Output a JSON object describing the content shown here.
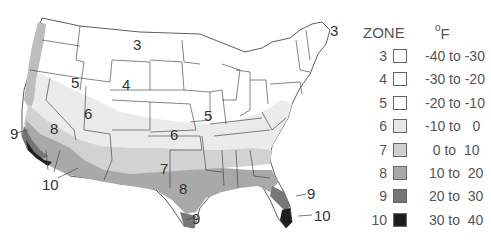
{
  "map": {
    "title": "Plant hardiness zones of the contiguous United States",
    "region_labels": [
      {
        "text": "3",
        "x": 133,
        "y": 36
      },
      {
        "text": "3",
        "x": 372,
        "y": 22
      },
      {
        "text": "4",
        "x": 122,
        "y": 76
      },
      {
        "text": "5",
        "x": 71,
        "y": 74
      },
      {
        "text": "5",
        "x": 204,
        "y": 107
      },
      {
        "text": "6",
        "x": 84,
        "y": 105
      },
      {
        "text": "6",
        "x": 170,
        "y": 126
      },
      {
        "text": "7",
        "x": 160,
        "y": 160
      },
      {
        "text": "8",
        "x": 50,
        "y": 120
      },
      {
        "text": "8",
        "x": 179,
        "y": 180
      },
      {
        "text": "9",
        "x": 10,
        "y": 128
      },
      {
        "text": "9",
        "x": 192,
        "y": 212
      },
      {
        "text": "9",
        "x": 307,
        "y": 187
      },
      {
        "text": "10",
        "x": 42,
        "y": 176
      },
      {
        "text": "10",
        "x": 314,
        "y": 208
      }
    ]
  },
  "legend": {
    "header_zone": "ZONE",
    "header_unit_sup": "o",
    "header_unit": "F",
    "rows": [
      {
        "zone": "3",
        "range": "-40 to -30",
        "color": "#ffffff"
      },
      {
        "zone": "4",
        "range": "-30 to -20",
        "color": "#ffffff"
      },
      {
        "zone": "5",
        "range": "-20 to -10",
        "color": "#ffffff"
      },
      {
        "zone": "6",
        "range": "-10 to   0",
        "color": "#e8e8e8"
      },
      {
        "zone": "7",
        "range": "  0 to  10",
        "color": "#cfcfcf"
      },
      {
        "zone": "8",
        "range": " 10 to  20",
        "color": "#a8a8a8"
      },
      {
        "zone": "9",
        "range": " 20 to  30",
        "color": "#777777"
      },
      {
        "zone": "10",
        "range": " 30 to  40",
        "color": "#1e1e1e"
      }
    ]
  }
}
